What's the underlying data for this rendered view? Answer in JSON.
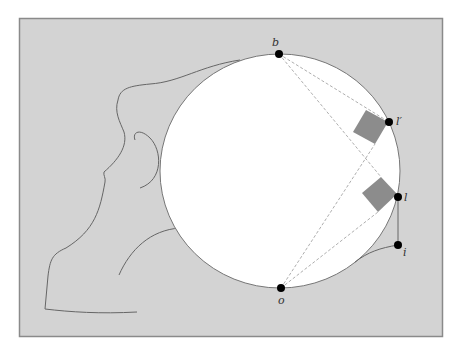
{
  "figure": {
    "background": "#d3d3d3",
    "frame_color": "#8a8a8a",
    "circle_fill": "#ffffff",
    "line_color": "#666666",
    "mirror_fill": "#8c8c8c",
    "point_color": "#000000"
  },
  "points": [
    {
      "id": "b",
      "label": "b",
      "x": 279,
      "y": 54,
      "label_x": 272,
      "label_y": 46
    },
    {
      "id": "l_prime",
      "label": "l′",
      "x": 389,
      "y": 122,
      "label_x": 396,
      "label_y": 125
    },
    {
      "id": "l",
      "label": "l",
      "x": 398,
      "y": 197,
      "label_x": 404,
      "label_y": 201
    },
    {
      "id": "i",
      "label": "i",
      "x": 398,
      "y": 245,
      "label_x": 403,
      "label_y": 256
    },
    {
      "id": "o",
      "label": "o",
      "x": 281,
      "y": 288,
      "label_x": 280,
      "label_y": 304
    }
  ],
  "labels": {
    "b": "b",
    "l_prime": "l′",
    "l": "l",
    "i": "i",
    "o": "o"
  }
}
